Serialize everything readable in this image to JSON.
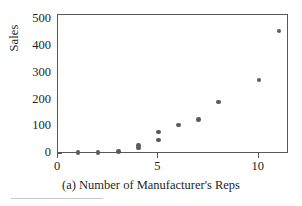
{
  "chart_data": {
    "type": "scatter",
    "title": "",
    "caption": "(a) Number of Manufacturer's Reps",
    "xlabel": "",
    "ylabel": "Sales",
    "xlim": [
      0,
      11.5
    ],
    "ylim": [
      0,
      520
    ],
    "grid": false,
    "legend": null,
    "marker": {
      "shape": "circle",
      "color": "#5b5b5d",
      "size": 4.6
    },
    "frame_color": "#58585a",
    "xticks": [
      0,
      5,
      10
    ],
    "xtick_labels": [
      "0",
      "5",
      "10"
    ],
    "xminor_ticks": [
      1,
      2,
      3,
      4,
      6,
      7,
      8,
      9,
      11
    ],
    "yticks": [
      0,
      100,
      200,
      300,
      400,
      500
    ],
    "ytick_labels": [
      "0",
      "100",
      "200",
      "300",
      "400",
      "500"
    ],
    "points": [
      {
        "x": 1,
        "y": 5
      },
      {
        "x": 2,
        "y": 5
      },
      {
        "x": 3,
        "y": 10
      },
      {
        "x": 4,
        "y": 22
      },
      {
        "x": 4,
        "y": 32
      },
      {
        "x": 5,
        "y": 53
      },
      {
        "x": 5,
        "y": 83
      },
      {
        "x": 6,
        "y": 108
      },
      {
        "x": 7,
        "y": 128
      },
      {
        "x": 8,
        "y": 195
      },
      {
        "x": 10,
        "y": 277
      },
      {
        "x": 11,
        "y": 460
      }
    ]
  },
  "figure": {
    "ylabel": "Sales",
    "caption": "(a) Number of Manufacturer's Reps"
  }
}
